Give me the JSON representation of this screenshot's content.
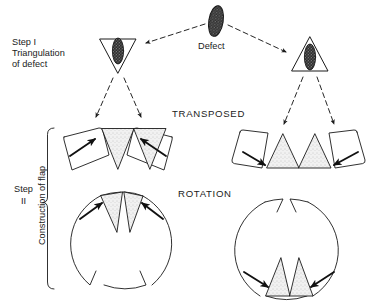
{
  "figure": {
    "background_color": "#ffffff",
    "line_color": "#1a1a1a",
    "stipple_fill_color": "#e8e8e8",
    "defect_fill_color": "#4a4a4a"
  },
  "labels": {
    "step_one": "Step I\nTriangulation\nof defect",
    "step_two": "Step\nII",
    "construction_of_flap": "Construction of flap",
    "defect": "Defect",
    "transposed": "TRANSPOSED",
    "rotation": "ROTATION"
  },
  "diagram": {
    "rows": [
      {
        "name": "step-one-row",
        "items": [
          {
            "name": "triangulated-defect-left",
            "shape": "inverted-triangle-with-defect",
            "fill": "defect"
          },
          {
            "name": "defect-blob",
            "shape": "stippled-ellipse",
            "fill": "defect"
          },
          {
            "name": "triangulated-defect-right",
            "shape": "upright-triangle-with-defect",
            "fill": "defect"
          }
        ]
      },
      {
        "name": "transposed-row",
        "items": [
          {
            "name": "transposed-flap-left",
            "shape": "two-inverted-triangles-with-rectangular-flaps",
            "arrows": 2,
            "arrow_direction": "inward-up"
          },
          {
            "name": "transposed-flap-right",
            "shape": "two-upright-triangles-with-rectangular-flaps",
            "arrows": 2,
            "arrow_direction": "inward-down"
          }
        ]
      },
      {
        "name": "rotation-row",
        "items": [
          {
            "name": "rotation-flap-left",
            "shape": "circle-with-top-triangle-excisions",
            "arrows": 2,
            "arrow_direction": "inward-up"
          },
          {
            "name": "rotation-flap-right",
            "shape": "circle-with-bottom-triangle-excisions",
            "arrows": 2,
            "arrow_direction": "inward-down"
          }
        ]
      }
    ],
    "connectors": [
      {
        "name": "defect-to-left-triangle",
        "style": "dashed-arrow"
      },
      {
        "name": "defect-to-right-triangle",
        "style": "dashed-arrow"
      },
      {
        "name": "left-triangle-to-transposed-a",
        "style": "dashed-arrow"
      },
      {
        "name": "left-triangle-to-transposed-b",
        "style": "dashed-arrow"
      },
      {
        "name": "right-triangle-to-transposed-a",
        "style": "dashed-arrow"
      },
      {
        "name": "right-triangle-to-transposed-b",
        "style": "dashed-arrow"
      }
    ],
    "brace": {
      "name": "step-two-brace",
      "orientation": "vertical-left"
    }
  }
}
